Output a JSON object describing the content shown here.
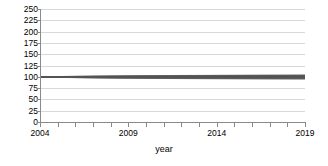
{
  "chart_data": {
    "type": "line",
    "title": "",
    "subtitle": "",
    "xlabel": "year",
    "ylabel": "",
    "xlim": [
      2004,
      2019
    ],
    "ylim": [
      0,
      250
    ],
    "grid": true,
    "legend": null,
    "y_ticks": [
      250,
      225,
      200,
      175,
      150,
      125,
      100,
      75,
      50,
      25,
      0
    ],
    "y_tick_labels": [
      "250",
      "225",
      "200",
      "175",
      "150",
      "125",
      "100",
      "75",
      "50",
      "25",
      "0"
    ],
    "x_ticks": [
      2004,
      2005,
      2006,
      2007,
      2008,
      2009,
      2010,
      2011,
      2012,
      2013,
      2014,
      2015,
      2016,
      2017,
      2018,
      2019
    ],
    "x_tick_labels_shown": [
      "2004",
      "2009",
      "2014",
      "2019"
    ],
    "x_tick_labels_shown_values": [
      2004,
      2009,
      2014,
      2019
    ],
    "x": [
      2004,
      2005,
      2006,
      2007,
      2008,
      2009,
      2010,
      2011,
      2012,
      2013,
      2014,
      2015,
      2016,
      2017,
      2018,
      2019
    ],
    "series_color": "#555555",
    "series_count": 40,
    "envelope": {
      "upper": [
        100,
        100.6,
        101.1,
        101.5,
        101.9,
        102.2,
        102.5,
        102.8,
        103.0,
        103.2,
        103.4,
        103.6,
        103.8,
        104.0,
        104.1,
        104.3
      ],
      "lower": [
        100,
        99.3,
        98.7,
        98.2,
        97.8,
        97.4,
        97.1,
        96.8,
        96.5,
        96.3,
        96.1,
        95.9,
        95.7,
        95.5,
        95.4,
        95.2
      ],
      "median": [
        100,
        99.95,
        99.9,
        99.85,
        99.85,
        99.8,
        99.8,
        99.8,
        99.75,
        99.75,
        99.75,
        99.75,
        99.75,
        99.7,
        99.7,
        99.7
      ]
    },
    "series": [
      {
        "name": "run-1",
        "values": [
          100,
          100.6,
          101.1,
          101.5,
          101.9,
          102.2,
          102.5,
          102.8,
          103.0,
          103.2,
          103.4,
          103.6,
          103.8,
          104.0,
          104.1,
          104.3
        ]
      },
      {
        "name": "run-2",
        "values": [
          100,
          100.5,
          100.9,
          101.3,
          101.6,
          101.9,
          102.1,
          102.3,
          102.5,
          102.7,
          102.9,
          103.0,
          103.2,
          103.3,
          103.4,
          103.6
        ]
      },
      {
        "name": "run-3",
        "values": [
          100,
          100.45,
          100.8,
          101.1,
          101.4,
          101.6,
          101.8,
          102.0,
          102.2,
          102.3,
          102.5,
          102.6,
          102.7,
          102.8,
          102.9,
          103.0
        ]
      },
      {
        "name": "run-4",
        "values": [
          100,
          100.4,
          100.7,
          101.0,
          101.2,
          101.4,
          101.6,
          101.8,
          101.9,
          102.0,
          102.1,
          102.2,
          102.3,
          102.4,
          102.5,
          102.6
        ]
      },
      {
        "name": "run-5",
        "values": [
          100,
          100.35,
          100.6,
          100.85,
          101.05,
          101.2,
          101.35,
          101.5,
          101.6,
          101.7,
          101.8,
          101.9,
          102.0,
          102.05,
          102.1,
          102.2
        ]
      },
      {
        "name": "run-6",
        "values": [
          100,
          100.3,
          100.55,
          100.75,
          100.9,
          101.05,
          101.15,
          101.3,
          101.4,
          101.45,
          101.55,
          101.6,
          101.65,
          101.7,
          101.75,
          101.8
        ]
      },
      {
        "name": "run-7",
        "values": [
          100,
          100.27,
          100.48,
          100.65,
          100.8,
          100.9,
          101.0,
          101.1,
          101.2,
          101.25,
          101.3,
          101.35,
          101.4,
          101.45,
          101.5,
          101.55
        ]
      },
      {
        "name": "run-8",
        "values": [
          100,
          100.24,
          100.42,
          100.56,
          100.68,
          100.78,
          100.86,
          100.94,
          101.0,
          101.05,
          101.1,
          101.14,
          101.18,
          101.22,
          101.25,
          101.3
        ]
      },
      {
        "name": "run-9",
        "values": [
          100,
          100.21,
          100.36,
          100.48,
          100.58,
          100.66,
          100.73,
          100.79,
          100.84,
          100.88,
          100.92,
          100.96,
          100.99,
          101.02,
          101.05,
          101.08
        ]
      },
      {
        "name": "run-10",
        "values": [
          100,
          100.18,
          100.31,
          100.41,
          100.49,
          100.56,
          100.61,
          100.66,
          100.7,
          100.74,
          100.77,
          100.8,
          100.83,
          100.85,
          100.88,
          100.9
        ]
      },
      {
        "name": "run-11",
        "values": [
          100,
          100.15,
          100.26,
          100.34,
          100.41,
          100.46,
          100.51,
          100.55,
          100.58,
          100.61,
          100.64,
          100.66,
          100.68,
          100.7,
          100.72,
          100.74
        ]
      },
      {
        "name": "run-12",
        "values": [
          100,
          100.13,
          100.22,
          100.29,
          100.34,
          100.39,
          100.42,
          100.46,
          100.48,
          100.51,
          100.53,
          100.55,
          100.57,
          100.58,
          100.6,
          100.61
        ]
      },
      {
        "name": "run-13",
        "values": [
          100,
          100.11,
          100.18,
          100.24,
          100.28,
          100.32,
          100.35,
          100.38,
          100.4,
          100.42,
          100.44,
          100.45,
          100.47,
          100.48,
          100.49,
          100.5
        ]
      },
      {
        "name": "run-14",
        "values": [
          100,
          100.09,
          100.15,
          100.2,
          100.23,
          100.26,
          100.29,
          100.31,
          100.33,
          100.34,
          100.36,
          100.37,
          100.38,
          100.39,
          100.4,
          100.41
        ]
      },
      {
        "name": "run-15",
        "values": [
          100,
          100.07,
          100.12,
          100.16,
          100.19,
          100.21,
          100.23,
          100.25,
          100.26,
          100.27,
          100.29,
          100.3,
          100.3,
          100.31,
          100.32,
          100.33
        ]
      },
      {
        "name": "run-16",
        "values": [
          100,
          100.06,
          100.1,
          100.13,
          100.15,
          100.17,
          100.18,
          100.2,
          100.21,
          100.22,
          100.23,
          100.23,
          100.24,
          100.25,
          100.25,
          100.26
        ]
      },
      {
        "name": "run-17",
        "values": [
          100,
          100.04,
          100.07,
          100.09,
          100.11,
          100.12,
          100.13,
          100.14,
          100.15,
          100.16,
          100.16,
          100.17,
          100.17,
          100.18,
          100.18,
          100.19
        ]
      },
      {
        "name": "run-18",
        "values": [
          100,
          100.03,
          100.05,
          100.06,
          100.07,
          100.08,
          100.09,
          100.09,
          100.1,
          100.1,
          100.11,
          100.11,
          100.11,
          100.12,
          100.12,
          100.12
        ]
      },
      {
        "name": "run-19",
        "values": [
          100,
          100.015,
          100.025,
          100.03,
          100.035,
          100.04,
          100.04,
          100.045,
          100.05,
          100.05,
          100.05,
          100.055,
          100.055,
          100.06,
          100.06,
          100.06
        ]
      },
      {
        "name": "run-20",
        "values": [
          100,
          100.0,
          100.0,
          100.0,
          100.0,
          100.0,
          100.0,
          100.0,
          100.0,
          100.0,
          100.0,
          100.0,
          100.0,
          100.0,
          100.0,
          100.0
        ]
      },
      {
        "name": "run-21",
        "values": [
          100,
          99.98,
          99.97,
          99.96,
          99.955,
          99.95,
          99.945,
          99.94,
          99.94,
          99.935,
          99.93,
          99.93,
          99.925,
          99.92,
          99.92,
          99.915
        ]
      },
      {
        "name": "run-22",
        "values": [
          100,
          99.96,
          99.93,
          99.91,
          99.9,
          99.89,
          99.88,
          99.87,
          99.865,
          99.86,
          99.855,
          99.85,
          99.845,
          99.84,
          99.84,
          99.835
        ]
      },
      {
        "name": "run-23",
        "values": [
          100,
          99.94,
          99.9,
          99.87,
          99.85,
          99.83,
          99.82,
          99.8,
          99.79,
          99.78,
          99.77,
          99.76,
          99.755,
          99.75,
          99.745,
          99.74
        ]
      },
      {
        "name": "run-24",
        "values": [
          100,
          99.92,
          99.86,
          99.82,
          99.79,
          99.77,
          99.75,
          99.73,
          99.71,
          99.7,
          99.69,
          99.68,
          99.67,
          99.66,
          99.65,
          99.64
        ]
      },
      {
        "name": "run-25",
        "values": [
          100,
          99.9,
          99.83,
          99.77,
          99.73,
          99.7,
          99.67,
          99.65,
          99.63,
          99.61,
          99.6,
          99.58,
          99.57,
          99.56,
          99.55,
          99.54
        ]
      },
      {
        "name": "run-26",
        "values": [
          100,
          99.87,
          99.78,
          99.71,
          99.66,
          99.62,
          99.59,
          99.56,
          99.54,
          99.51,
          99.49,
          99.48,
          99.46,
          99.45,
          99.43,
          99.42
        ]
      },
      {
        "name": "run-27",
        "values": [
          100,
          99.84,
          99.73,
          99.65,
          99.59,
          99.54,
          99.5,
          99.47,
          99.44,
          99.41,
          99.39,
          99.37,
          99.35,
          99.34,
          99.32,
          99.31
        ]
      },
      {
        "name": "run-28",
        "values": [
          100,
          99.81,
          99.68,
          99.58,
          99.51,
          99.45,
          99.41,
          99.37,
          99.33,
          99.3,
          99.28,
          99.25,
          99.23,
          99.21,
          99.2,
          99.18
        ]
      },
      {
        "name": "run-29",
        "values": [
          100,
          99.77,
          99.61,
          99.5,
          99.41,
          99.34,
          99.29,
          99.24,
          99.2,
          99.17,
          99.13,
          99.11,
          99.08,
          99.06,
          99.04,
          99.02
        ]
      },
      {
        "name": "run-30",
        "values": [
          100,
          99.73,
          99.54,
          99.41,
          99.31,
          99.23,
          99.16,
          99.11,
          99.06,
          99.02,
          98.98,
          98.95,
          98.92,
          98.89,
          98.87,
          98.84
        ]
      },
      {
        "name": "run-31",
        "values": [
          100,
          99.68,
          99.46,
          99.3,
          99.18,
          99.09,
          99.01,
          98.94,
          98.89,
          98.84,
          98.79,
          98.75,
          98.72,
          98.68,
          98.65,
          98.62
        ]
      },
      {
        "name": "run-32",
        "values": [
          100,
          99.62,
          99.36,
          99.17,
          99.03,
          98.92,
          98.82,
          98.74,
          98.67,
          98.61,
          98.56,
          98.51,
          98.47,
          98.43,
          98.39,
          98.36
        ]
      },
      {
        "name": "run-33",
        "values": [
          100,
          99.55,
          99.25,
          99.02,
          98.85,
          98.72,
          98.6,
          98.51,
          98.42,
          98.35,
          98.29,
          98.23,
          98.18,
          98.13,
          98.09,
          98.04
        ]
      },
      {
        "name": "run-34",
        "values": [
          100,
          99.47,
          99.11,
          98.85,
          98.64,
          98.48,
          98.34,
          98.23,
          98.13,
          98.04,
          97.97,
          97.9,
          97.84,
          97.78,
          97.73,
          97.68
        ]
      },
      {
        "name": "run-35",
        "values": [
          100,
          99.38,
          98.95,
          98.64,
          98.4,
          98.21,
          98.04,
          97.91,
          97.79,
          97.69,
          97.6,
          97.52,
          97.45,
          97.38,
          97.32,
          97.26
        ]
      },
      {
        "name": "run-36",
        "values": [
          100,
          99.28,
          98.78,
          98.41,
          98.13,
          97.9,
          97.71,
          97.55,
          97.41,
          97.29,
          97.19,
          97.09,
          97.01,
          96.93,
          96.86,
          96.79
        ]
      },
      {
        "name": "run-37",
        "values": [
          100,
          99.17,
          98.58,
          98.15,
          97.83,
          97.56,
          97.34,
          97.16,
          97.0,
          96.86,
          96.74,
          96.63,
          96.53,
          96.44,
          96.36,
          96.28
        ]
      },
      {
        "name": "run-38",
        "values": [
          100,
          99.06,
          98.39,
          97.9,
          97.53,
          97.23,
          96.98,
          96.77,
          96.59,
          96.44,
          96.3,
          96.17,
          96.06,
          95.96,
          95.87,
          95.78
        ]
      },
      {
        "name": "run-39",
        "values": [
          100,
          98.95,
          98.2,
          97.66,
          97.24,
          96.91,
          96.63,
          96.4,
          96.2,
          96.03,
          95.87,
          95.74,
          95.61,
          95.5,
          95.4,
          95.3
        ]
      },
      {
        "name": "run-40",
        "values": [
          100,
          98.9,
          98.12,
          97.56,
          97.13,
          96.78,
          96.49,
          96.25,
          96.04,
          95.86,
          95.7,
          95.56,
          95.43,
          95.32,
          95.21,
          95.12
        ]
      }
    ]
  },
  "axes": {
    "x_title": "year",
    "y_title": ""
  }
}
